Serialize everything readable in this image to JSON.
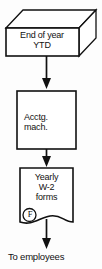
{
  "diagram": {
    "orientation": "vertical-top-to-bottom",
    "colors": {
      "stroke": "#111111",
      "fill": "#ffffff",
      "background": "#fdfdfd",
      "text": "#111111"
    },
    "nodes": [
      {
        "id": "start",
        "shape": "box-3d",
        "label": "End of year\nYTD",
        "line1": "End of year",
        "line2": "YTD"
      },
      {
        "id": "process",
        "shape": "rectangle",
        "label": "Acctg.\nmach.",
        "line1": "Acctg.",
        "line2": "mach."
      },
      {
        "id": "document",
        "shape": "document",
        "label": "Yearly\nW-2\nforms",
        "line1": "Yearly",
        "line2": "W-2",
        "line3": "forms",
        "reference_marker": "F"
      },
      {
        "id": "terminal",
        "shape": "text-only",
        "label": "To employees"
      }
    ],
    "connectors": [
      {
        "id": "start-to-process",
        "from": "start",
        "to": "process",
        "arrowhead": "filled-triangle"
      },
      {
        "id": "process-to-document",
        "from": "process",
        "to": "document",
        "arrowhead": "filled-triangle"
      },
      {
        "id": "document-to-terminal",
        "from": "document",
        "to": "terminal",
        "arrowhead": "filled-triangle"
      }
    ]
  }
}
